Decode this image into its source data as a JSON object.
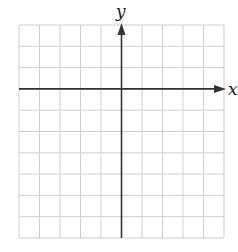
{
  "diagram": {
    "type": "coordinate-grid",
    "x_label": "x",
    "y_label": "y",
    "grid": {
      "columns": 10,
      "rows": 10,
      "left": 19,
      "top": 25,
      "right": 224,
      "bottom": 238
    },
    "x_axis_row": 3,
    "y_axis_col": 5,
    "colors": {
      "grid": "#cfcfcf",
      "axis": "#333333",
      "background": "#ffffff"
    }
  }
}
